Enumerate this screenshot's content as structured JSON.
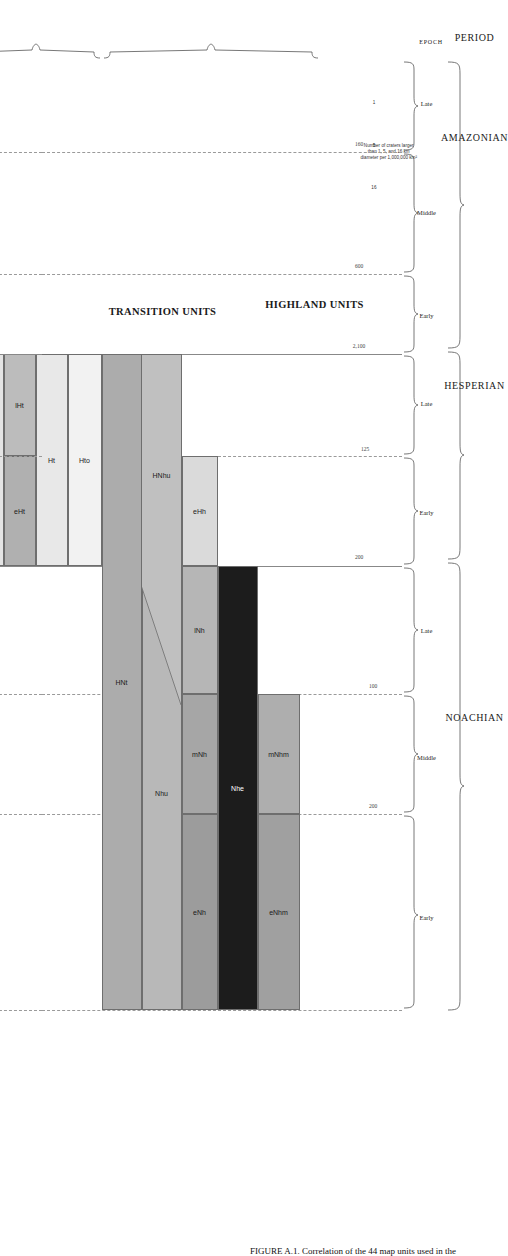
{
  "figure": {
    "caption": "FIGURE A.1. Correlation of the 44 map units used in the",
    "axis_headers": {
      "period": "PERIOD",
      "epoch": "EPOCH",
      "epoch_small": "EPOCH"
    },
    "crater_legend": {
      "line1": "Number of craters larger",
      "line2": "than 1, 5, and 16 km",
      "line3": "diameter per 1,000,000 km²",
      "ticks": [
        "1",
        "5",
        "16"
      ]
    }
  },
  "periods": [
    {
      "name": "AMAZONIAN"
    },
    {
      "name": "HESPERIAN"
    },
    {
      "name": "NOACHIAN"
    }
  ],
  "epochs": [
    {
      "label": "Late",
      "period": "AMAZONIAN"
    },
    {
      "label": "Middle",
      "period": "AMAZONIAN"
    },
    {
      "label": "Early",
      "period": "AMAZONIAN"
    },
    {
      "label": "Late",
      "period": "HESPERIAN"
    },
    {
      "label": "Early",
      "period": "HESPERIAN"
    },
    {
      "label": "Late",
      "period": "NOACHIAN"
    },
    {
      "label": "Middle",
      "period": "NOACHIAN"
    },
    {
      "label": "Early",
      "period": "NOACHIAN"
    }
  ],
  "boundary_values": [
    "160",
    "600",
    "2,100",
    "125",
    "200",
    "100",
    "200"
  ],
  "categories": [
    {
      "key": "lowland",
      "title": "LOWLAND\nUNITS",
      "title_l1": "LOWLAND",
      "title_l2": "UNITS"
    },
    {
      "key": "impact",
      "title": "IMPACT\nUNIT",
      "title_l1": "IMPACT",
      "title_l2": "UNIT"
    },
    {
      "key": "polar",
      "title": "POLAR UNITS"
    },
    {
      "key": "basin",
      "title": "BASIN UNITS"
    },
    {
      "key": "volcanic",
      "title": "VOLCANIC UNITS"
    },
    {
      "key": "apron",
      "title": "APRON UNITS"
    },
    {
      "key": "transition",
      "title": "TRANSITION UNITS"
    },
    {
      "key": "highland",
      "title": "HIGHLAND UNITS"
    }
  ],
  "chart_data": {
    "type": "table",
    "xlabel": "Epoch / Period",
    "ylabel": "Map unit group",
    "categories": [
      "Late Amazonian",
      "Middle Amazonian",
      "Early Amazonian",
      "Late Hesperian",
      "Early Hesperian",
      "Late Noachian",
      "Middle Noachian",
      "Early Noachian"
    ],
    "units": [
      {
        "code": "mAl",
        "group": "lowland",
        "fill": "#a8a8a8"
      },
      {
        "code": "lHl",
        "group": "lowland",
        "fill": "#b4b4b4"
      },
      {
        "code": "AHi",
        "group": "impact",
        "fill": "#f0f0f0"
      },
      {
        "code": "lApc",
        "group": "polar",
        "fill": "#fafafa"
      },
      {
        "code": "lApd",
        "group": "polar",
        "fill": "#f2f2f2"
      },
      {
        "code": "Apu",
        "group": "polar",
        "fill": "#a8a8a8"
      },
      {
        "code": "Ap",
        "group": "polar",
        "fill": "#949494"
      },
      {
        "code": "Hp",
        "group": "polar",
        "fill": "#8e8e8e"
      },
      {
        "code": "Hpu",
        "group": "polar",
        "fill": "#acacac"
      },
      {
        "code": "Hpe",
        "group": "polar",
        "fill": "#8a8a8a"
      },
      {
        "code": "eAb",
        "group": "basin",
        "fill": "#e2e2e2"
      },
      {
        "code": "lHb",
        "group": "basin",
        "fill": "#bcbcbc"
      },
      {
        "code": "eHb",
        "group": "basin",
        "fill": "#b4b4b4"
      },
      {
        "code": "HNb",
        "group": "basin",
        "fill": "#b0b0b0"
      },
      {
        "code": "lAv",
        "group": "volcanic",
        "fill": "#d6d6d6"
      },
      {
        "code": "lAvf",
        "group": "volcanic",
        "fill": "#bdbdbd"
      },
      {
        "code": "Av",
        "group": "volcanic",
        "fill": "#cfcfcf"
      },
      {
        "code": "AHv",
        "group": "volcanic",
        "fill": "#c9c9c9"
      },
      {
        "code": "lHvf",
        "group": "volcanic",
        "fill": "#c2c2c2"
      },
      {
        "code": "lHv",
        "group": "volcanic",
        "fill": "#9a9a9a"
      },
      {
        "code": "eHv",
        "group": "volcanic",
        "fill": "#9e9e9e"
      },
      {
        "code": "lNv",
        "group": "volcanic",
        "fill": "#a2a2a2"
      },
      {
        "code": "Hve",
        "group": "volcanic",
        "fill": "#8f8f8f"
      },
      {
        "code": "lAa",
        "group": "apron",
        "fill": "#dcdcdc"
      },
      {
        "code": "Aa",
        "group": "apron",
        "fill": "#dcdcdc"
      },
      {
        "code": "ANa",
        "group": "apron",
        "fill": "#a6a6a6"
      },
      {
        "code": "AHtu",
        "group": "apron",
        "fill": "#f0f0f0"
      },
      {
        "code": "Nve",
        "group": "apron",
        "fill": "#1c1c1c",
        "text": "#ffffff"
      },
      {
        "code": "Ave",
        "group": "apron",
        "fill": "#8f8f8f"
      },
      {
        "code": "Htu",
        "group": "transition",
        "fill": "#e4e4e4"
      },
      {
        "code": "lHt",
        "group": "transition",
        "fill": "#bcbcbc"
      },
      {
        "code": "eHt",
        "group": "transition",
        "fill": "#b0b0b0"
      },
      {
        "code": "Ht",
        "group": "transition",
        "fill": "#e8e8e8"
      },
      {
        "code": "Hto",
        "group": "transition",
        "fill": "#f2f2f2"
      },
      {
        "code": "HNt",
        "group": "highland",
        "fill": "#acacac"
      },
      {
        "code": "HNhu",
        "group": "highland",
        "fill": "#c0c0c0"
      },
      {
        "code": "Nhu",
        "group": "highland",
        "fill": "#b8b8b8"
      },
      {
        "code": "eHh",
        "group": "highland",
        "fill": "#dadada"
      },
      {
        "code": "lNh",
        "group": "highland",
        "fill": "#b6b6b6"
      },
      {
        "code": "mNh",
        "group": "highland",
        "fill": "#a6a6a6"
      },
      {
        "code": "eNh",
        "group": "highland",
        "fill": "#9c9c9c"
      },
      {
        "code": "Nhe",
        "group": "highland",
        "fill": "#1c1c1c",
        "text": "#ffffff"
      },
      {
        "code": "mNhm",
        "group": "highland",
        "fill": "#aeaeae"
      },
      {
        "code": "eNhm",
        "group": "highland",
        "fill": "#a0a0a0"
      }
    ]
  }
}
